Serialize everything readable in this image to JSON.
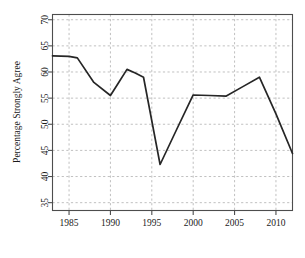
{
  "chart_data": {
    "type": "line",
    "title": "",
    "subtitle": "",
    "xlabel": "",
    "ylabel": "Percentage Strongly Agree",
    "xlim": [
      1983,
      2012
    ],
    "ylim": [
      33.5,
      71
    ],
    "grid": true,
    "grid_style": "dashed",
    "legend": "none",
    "xticks": [
      1985,
      1990,
      1995,
      2000,
      2005,
      2010
    ],
    "xtick_labels": [
      "1985",
      "1990",
      "1995",
      "2000",
      "2005",
      "2010"
    ],
    "yticks": [
      35,
      40,
      45,
      50,
      55,
      60,
      65,
      70
    ],
    "ytick_labels": [
      "35",
      "40",
      "45",
      "50",
      "55",
      "60",
      "65",
      "70"
    ],
    "series": [
      {
        "name": "Percentage Strongly Agree",
        "color": "#262626",
        "x": [
          1983,
          1985,
          1986,
          1988,
          1990,
          1991,
          1992,
          1993,
          1994,
          1996,
          1998,
          2000,
          2002,
          2004,
          2006,
          2008,
          2010,
          2012
        ],
        "values": [
          63.1,
          63.0,
          62.7,
          58.0,
          55.5,
          58.0,
          60.5,
          59.8,
          59.0,
          42.3,
          49.0,
          55.6,
          55.5,
          55.4,
          57.2,
          59.0,
          52.0,
          44.4
        ]
      }
    ]
  },
  "axis": {
    "y_title": "Percentage Strongly Agree"
  }
}
